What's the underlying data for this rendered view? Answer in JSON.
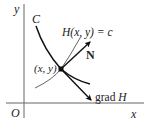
{
  "diagram": {
    "type": "gradient-normal-to-level-curve",
    "axes": {
      "x_label": "x",
      "y_label": "y",
      "origin_label": "O"
    },
    "labels": {
      "curve": "C",
      "level_curve": "H(x, y) = c",
      "point": "(x, y)",
      "normal": "N",
      "gradient": "grad H"
    },
    "colors": {
      "curve": "#111111",
      "level_curve": "#555555",
      "axes": "#555555",
      "text": "#222222"
    }
  }
}
